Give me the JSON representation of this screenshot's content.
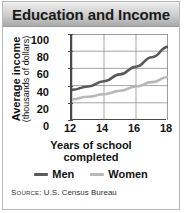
{
  "figure": {
    "title": "Education and Income",
    "border_color": "#b9b9b9",
    "titlebar_color": "#cfcfcf"
  },
  "source": {
    "label": "Source:",
    "text": " U.S. Census Bureau"
  },
  "chart_data": {
    "type": "line",
    "title": "Education and Income",
    "xlabel_line1": "Years of school",
    "xlabel_line2": "completed",
    "ylabel_line1": "Average income",
    "ylabel_line2": "(thousands of dollars)",
    "xlim": [
      12,
      18
    ],
    "ylim": [
      0,
      100
    ],
    "xticks": [
      12,
      14,
      16,
      18
    ],
    "yticks": [
      0,
      20,
      40,
      60,
      80,
      100
    ],
    "grid": true,
    "legend_position": "bottom",
    "x": [
      12,
      13,
      14,
      15,
      16,
      17,
      18
    ],
    "series": [
      {
        "name": "Men",
        "color": "#5a5a5a",
        "values": [
          35,
          39,
          45,
          53,
          62,
          73,
          85
        ]
      },
      {
        "name": "Women",
        "color": "#b8b8b8",
        "values": [
          24,
          27,
          30,
          34,
          39,
          44,
          50
        ]
      }
    ]
  }
}
